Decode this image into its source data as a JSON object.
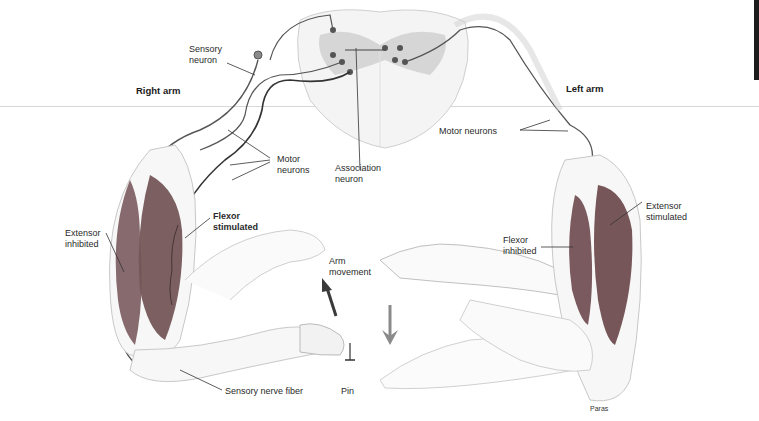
{
  "figure": {
    "title_right": "Right arm",
    "title_left": "Left arm",
    "credit": "Paras"
  },
  "labels": {
    "sensory_neuron": [
      "Sensory",
      "neuron"
    ],
    "motor_neurons_right": [
      "Motor",
      "neurons"
    ],
    "association_neuron": [
      "Association",
      "neuron"
    ],
    "motor_neurons_left": "Motor neurons",
    "extensor_inhibited": [
      "Extensor",
      "inhibited"
    ],
    "flexor_stimulated": [
      "Flexor",
      "stimulated"
    ],
    "arm_movement": [
      "Arm",
      "movement"
    ],
    "sensory_nerve_fiber": "Sensory nerve fiber",
    "pin": "Pin",
    "flexor_inhibited": [
      "Flexor",
      "inhibited"
    ],
    "extensor_stimulated": [
      "Extensor",
      "stimulated"
    ]
  },
  "colors": {
    "muscle": "#7a5a5e",
    "muscle_dark": "#5e4245",
    "nerve": "#4a4a4a",
    "gray_matter": "#cfcfcf",
    "outline": "#bdbdbd",
    "arrow_up": "#3a3a3a",
    "arrow_down": "#8a8a8a"
  }
}
